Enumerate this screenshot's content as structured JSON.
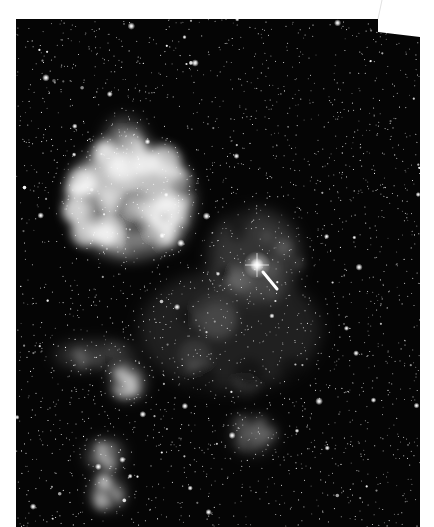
{
  "image": {
    "subject": "Astronomical photograph of a star field with bright emission nebulae and an arrow marking a bright star",
    "background_color": "#ffffff",
    "sky_color": "#050505",
    "frame": {
      "polygon": [
        [
          16,
          19
        ],
        [
          378,
          19
        ],
        [
          378,
          32
        ],
        [
          420,
          37
        ],
        [
          420,
          527
        ],
        [
          16,
          527
        ]
      ],
      "torn_edge_line": [
        [
          378,
          19
        ],
        [
          382,
          0
        ]
      ]
    },
    "nebulae": [
      {
        "name": "large-bright-nebula",
        "cx": 130,
        "cy": 200,
        "rx": 60,
        "ry": 55,
        "intensity": 1.0
      },
      {
        "name": "nebula-filament-north",
        "cx": 125,
        "cy": 150,
        "rx": 20,
        "ry": 30,
        "intensity": 0.6
      },
      {
        "name": "nebula-east-knot",
        "cx": 165,
        "cy": 230,
        "rx": 18,
        "ry": 16,
        "intensity": 0.55
      },
      {
        "name": "diffuse-region-around-marked-star",
        "cx": 255,
        "cy": 255,
        "rx": 45,
        "ry": 45,
        "intensity": 0.25
      },
      {
        "name": "nebula-south-knot",
        "cx": 128,
        "cy": 382,
        "rx": 14,
        "ry": 14,
        "intensity": 0.75
      },
      {
        "name": "nebula-filament-southwest",
        "cx": 95,
        "cy": 355,
        "rx": 40,
        "ry": 12,
        "intensity": 0.3
      },
      {
        "name": "nebula-bottom-left-a",
        "cx": 105,
        "cy": 455,
        "rx": 16,
        "ry": 12,
        "intensity": 0.6
      },
      {
        "name": "nebula-bottom-left-b",
        "cx": 108,
        "cy": 492,
        "rx": 14,
        "ry": 14,
        "intensity": 0.65
      },
      {
        "name": "cluster-south-center",
        "cx": 253,
        "cy": 435,
        "rx": 20,
        "ry": 16,
        "intensity": 0.35
      },
      {
        "name": "diffuse-band-center",
        "cx": 230,
        "cy": 330,
        "rx": 90,
        "ry": 60,
        "intensity": 0.15
      }
    ],
    "marked_star": {
      "x": 257,
      "y": 265,
      "radius": 7
    },
    "arrow": {
      "x1": 277,
      "y1": 289,
      "x2": 263,
      "y2": 272,
      "color": "#ffffff"
    },
    "star_count": 2600
  }
}
